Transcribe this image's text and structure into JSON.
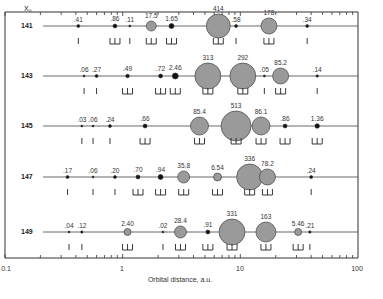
{
  "figure": {
    "corner_label": "X₀",
    "xlabel": "Orbital distance, a.u.",
    "x_ticks": [
      "0.1",
      "1",
      "10",
      "100"
    ]
  },
  "chart_data": {
    "type": "scatter",
    "title": "",
    "xlabel": "Orbital distance, a.u.",
    "ylabel": "X₀",
    "xscale": "log",
    "xlim": [
      0.1,
      100
    ],
    "rows": [
      {
        "x0": "141",
        "bodies": [
          {
            "a": 0.42,
            "mass": ".41",
            "r": 1.5
          },
          {
            "a": 0.86,
            "mass": ".86",
            "r": 2
          },
          {
            "a": 1.15,
            "mass": ".11",
            "r": 1
          },
          {
            "a": 1.75,
            "mass": "17.5",
            "r": 5
          },
          {
            "a": 2.6,
            "mass": "1.65",
            "r": 2.5
          },
          {
            "a": 6.5,
            "mass": "414",
            "r": 12
          },
          {
            "a": 9.2,
            "mass": ".58",
            "r": 1.5
          },
          {
            "a": 17.5,
            "mass": "178",
            "r": 8
          },
          {
            "a": 37,
            "mass": ".34",
            "r": 1.5
          }
        ]
      },
      {
        "x0": "143",
        "bodies": [
          {
            "a": 0.47,
            "mass": ".06",
            "r": 1
          },
          {
            "a": 0.6,
            "mass": ".27",
            "r": 1.5
          },
          {
            "a": 1.1,
            "mass": ".49",
            "r": 1.8
          },
          {
            "a": 2.1,
            "mass": ".72",
            "r": 2
          },
          {
            "a": 2.8,
            "mass": "2.46",
            "r": 3
          },
          {
            "a": 5.3,
            "mass": "313",
            "r": 13
          },
          {
            "a": 10.5,
            "mass": "292",
            "r": 13
          },
          {
            "a": 16,
            "mass": ".05",
            "r": 1
          },
          {
            "a": 22,
            "mass": "85.2",
            "r": 8
          },
          {
            "a": 45,
            "mass": ".14",
            "r": 1.2
          }
        ]
      },
      {
        "x0": "145",
        "bodies": [
          {
            "a": 0.45,
            "mass": ".03",
            "r": 1
          },
          {
            "a": 0.56,
            "mass": ".06",
            "r": 1
          },
          {
            "a": 0.78,
            "mass": ".24",
            "r": 1.5
          },
          {
            "a": 1.55,
            "mass": ".66",
            "r": 2
          },
          {
            "a": 4.5,
            "mass": "85.4",
            "r": 9
          },
          {
            "a": 9.2,
            "mass": "513",
            "r": 15
          },
          {
            "a": 15,
            "mass": "86.1",
            "r": 9
          },
          {
            "a": 24,
            "mass": ".86",
            "r": 2
          },
          {
            "a": 45,
            "mass": "1.36",
            "r": 2.3
          }
        ]
      },
      {
        "x0": "147",
        "bodies": [
          {
            "a": 0.34,
            "mass": ".17",
            "r": 1.5
          },
          {
            "a": 0.56,
            "mass": ".06",
            "r": 1
          },
          {
            "a": 0.86,
            "mass": ".20",
            "r": 1.5
          },
          {
            "a": 1.35,
            "mass": ".70",
            "r": 2
          },
          {
            "a": 2.1,
            "mass": ".94",
            "r": 2.5
          },
          {
            "a": 3.3,
            "mass": "35.8",
            "r": 6
          },
          {
            "a": 6.4,
            "mass": "6.54",
            "r": 4
          },
          {
            "a": 12,
            "mass": "336",
            "r": 13
          },
          {
            "a": 17,
            "mass": "78.2",
            "r": 8
          },
          {
            "a": 40,
            "mass": ".24",
            "r": 1.5
          }
        ]
      },
      {
        "x0": "149",
        "bodies": [
          {
            "a": 0.35,
            "mass": ".04",
            "r": 1
          },
          {
            "a": 0.45,
            "mass": ".12",
            "r": 1.2
          },
          {
            "a": 1.1,
            "mass": "2.40",
            "r": 3.5
          },
          {
            "a": 2.2,
            "mass": ".02",
            "r": 1
          },
          {
            "a": 3.1,
            "mass": "28.4",
            "r": 6
          },
          {
            "a": 5.3,
            "mass": ".91",
            "r": 2
          },
          {
            "a": 8.5,
            "mass": "331",
            "r": 13
          },
          {
            "a": 16.5,
            "mass": "163",
            "r": 10
          },
          {
            "a": 31,
            "mass": "5.46",
            "r": 3.5
          },
          {
            "a": 39,
            "mass": ".21",
            "r": 1.2
          }
        ]
      }
    ]
  }
}
